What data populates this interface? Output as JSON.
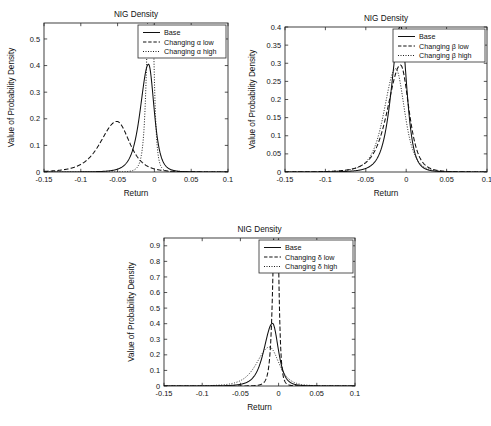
{
  "chart_data": [
    {
      "id": "alpha",
      "type": "line",
      "title": "NIG Density",
      "xlabel": "Return",
      "ylabel": "Value of Probability Density",
      "xlim": [
        -0.15,
        0.1
      ],
      "ylim": [
        0,
        0.56
      ],
      "xticks": [
        -0.15,
        -0.1,
        -0.05,
        0,
        0.05,
        0.1
      ],
      "xticklabels": [
        "-0.15",
        "-0.1",
        "-0.05",
        "0",
        "0.05",
        "0.1"
      ],
      "yticks": [
        0,
        0.1,
        0.2,
        0.3,
        0.4,
        0.5
      ],
      "yticklabels": [
        "0",
        "0.1",
        "0.2",
        "0.3",
        "0.4",
        "0.5"
      ],
      "grid": false,
      "legend_position": "top-right",
      "series": [
        {
          "name": "Base",
          "style": "solid",
          "peak_x": -0.008,
          "peak_y": 0.405,
          "scale": 0.0092,
          "skew": 0.45,
          "tail": 1.35
        },
        {
          "name": "Changing α low",
          "style": "dashed",
          "peak_x": -0.051,
          "peak_y": 0.19,
          "scale": 0.0205,
          "skew": 0.3,
          "tail": 1.45
        },
        {
          "name": "Changing α high",
          "style": "dotted",
          "peak_x": -0.005,
          "peak_y": 0.95,
          "scale": 0.0042,
          "skew": 0.25,
          "tail": 1.3
        }
      ]
    },
    {
      "id": "beta",
      "type": "line",
      "title": "NIG Density",
      "xlabel": "Return",
      "ylabel": "Value of Probability Density",
      "xlim": [
        -0.15,
        0.1
      ],
      "ylim": [
        0,
        0.4
      ],
      "xticks": [
        -0.15,
        -0.1,
        -0.05,
        0,
        0.05,
        0.1
      ],
      "xticklabels": [
        "-0.15",
        "-0.1",
        "-0.05",
        "0",
        "0.05",
        "0.1"
      ],
      "yticks": [
        0,
        0.05,
        0.1,
        0.15,
        0.2,
        0.25,
        0.3,
        0.35,
        0.4
      ],
      "yticklabels": [
        "0",
        "0.05",
        "0.1",
        "0.15",
        "0.2",
        "0.25",
        "0.3",
        "0.35",
        "0.4"
      ],
      "grid": false,
      "legend_position": "top-right",
      "series": [
        {
          "name": "Base",
          "style": "solid",
          "peak_x": -0.007,
          "peak_y": 0.403,
          "scale": 0.0092,
          "skew": 0.45,
          "tail": 1.35
        },
        {
          "name": "Changing β low",
          "style": "dashed",
          "peak_x": -0.007,
          "peak_y": 0.295,
          "scale": 0.0125,
          "skew": 0.55,
          "tail": 1.4
        },
        {
          "name": "Changing β high",
          "style": "dotted",
          "peak_x": -0.013,
          "peak_y": 0.285,
          "scale": 0.0132,
          "skew": 0.3,
          "tail": 1.5
        }
      ]
    },
    {
      "id": "delta",
      "type": "line",
      "title": "NIG Density",
      "xlabel": "Return",
      "ylabel": "Value of Probability Density",
      "xlim": [
        -0.15,
        0.1
      ],
      "ylim": [
        0,
        0.95
      ],
      "xticks": [
        -0.15,
        -0.1,
        -0.05,
        0,
        0.05,
        0.1
      ],
      "xticklabels": [
        "-0.15",
        "-0.1",
        "-0.05",
        "0",
        "0.05",
        "0.1"
      ],
      "yticks": [
        0,
        0.1,
        0.2,
        0.3,
        0.4,
        0.5,
        0.6,
        0.7,
        0.8,
        0.9
      ],
      "yticklabels": [
        "0",
        "0.1",
        "0.2",
        "0.3",
        "0.4",
        "0.5",
        "0.6",
        "0.7",
        "0.8",
        "0.9"
      ],
      "grid": false,
      "legend_position": "top-right",
      "series": [
        {
          "name": "Base",
          "style": "solid",
          "peak_x": -0.008,
          "peak_y": 0.402,
          "scale": 0.0092,
          "skew": 0.45,
          "tail": 1.35
        },
        {
          "name": "Changing δ low",
          "style": "dashed",
          "peak_x": -0.003,
          "peak_y": 1.6,
          "scale": 0.0032,
          "skew": 0.35,
          "tail": 1.2
        },
        {
          "name": "Changing δ high",
          "style": "dotted",
          "peak_x": -0.012,
          "peak_y": 0.25,
          "scale": 0.0148,
          "skew": 0.35,
          "tail": 1.45
        }
      ]
    }
  ]
}
